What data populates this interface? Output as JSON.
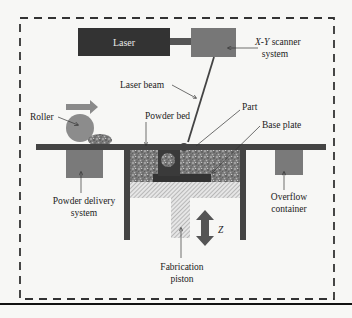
{
  "diagram": {
    "type": "schematic",
    "labels": {
      "laser": "Laser",
      "scanner_line1": "X-Y",
      "scanner_line2": " scanner",
      "scanner_line3": "system",
      "laser_beam": "Laser beam",
      "roller": "Roller",
      "powder_bed": "Powder bed",
      "part": "Part",
      "base_plate": "Base plate",
      "powder_delivery_line1": "Powder delivery",
      "powder_delivery_line2": "system",
      "overflow_line1": "Overflow",
      "overflow_line2": "container",
      "fabrication_line1": "Fabrication",
      "fabrication_line2": "piston",
      "z_axis": "Z"
    },
    "colors": {
      "laser_box": "#333333",
      "scanner_box": "#777777",
      "structure": "#444444",
      "roller": "#8c8c8c",
      "roller_arrow": "#8a8a8a",
      "container": "#7a7a7a",
      "dashed_border": "#333333",
      "background": "#f7f7f5"
    }
  }
}
